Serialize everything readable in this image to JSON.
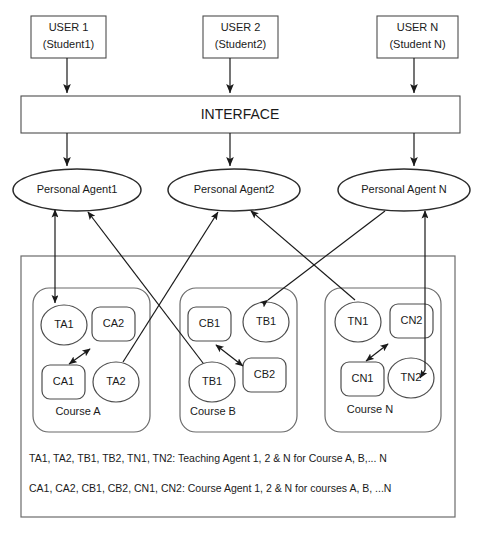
{
  "diagram": {
    "users": [
      {
        "id": "user1",
        "line1": "USER 1",
        "line2": "(Student1)"
      },
      {
        "id": "user2",
        "line1": "USER 2",
        "line2": "(Student2)"
      },
      {
        "id": "userN",
        "line1": "USER N",
        "line2": "(Student N)"
      }
    ],
    "interface": {
      "label": "INTERFACE"
    },
    "agents": [
      {
        "id": "pa1",
        "label": "Personal Agent1"
      },
      {
        "id": "pa2",
        "label": "Personal Agent2"
      },
      {
        "id": "paN",
        "label": "Personal Agent N"
      }
    ],
    "courses": [
      {
        "id": "courseA",
        "label": "Course A",
        "nodes": [
          {
            "id": "ta1",
            "label": "TA1",
            "shape": "ellipse"
          },
          {
            "id": "ca2",
            "label": "CA2",
            "shape": "rounded-rect"
          },
          {
            "id": "ca1",
            "label": "CA1",
            "shape": "rounded-rect"
          },
          {
            "id": "ta2",
            "label": "TA2",
            "shape": "ellipse"
          }
        ]
      },
      {
        "id": "courseB",
        "label": "Course B",
        "nodes": [
          {
            "id": "cb1",
            "label": "CB1",
            "shape": "rounded-rect"
          },
          {
            "id": "tb1_top",
            "label": "TB1",
            "shape": "ellipse"
          },
          {
            "id": "tb1_bottom",
            "label": "TB1",
            "shape": "ellipse"
          },
          {
            "id": "cb2",
            "label": "CB2",
            "shape": "rounded-rect"
          }
        ]
      },
      {
        "id": "courseN",
        "label": "Course N",
        "nodes": [
          {
            "id": "tn1",
            "label": "TN1",
            "shape": "ellipse"
          },
          {
            "id": "cn2",
            "label": "CN2",
            "shape": "rounded-rect"
          },
          {
            "id": "cn1",
            "label": "CN1",
            "shape": "rounded-rect"
          },
          {
            "id": "tn2",
            "label": "TN2",
            "shape": "ellipse"
          }
        ]
      }
    ],
    "legend": {
      "line1": "TA1, TA2, TB1, TB2, TN1, TN2: Teaching Agent 1, 2 & N for Course A, B,... N",
      "line2": "CA1, CA2, CB1, CB2, CN1, CN2: Course Agent 1, 2 & N for courses A, B, ...N"
    },
    "colors": {
      "stroke": "#1a1a1a",
      "box_stroke": "#4d4d4d",
      "container_stroke": "#6b6b6b",
      "background": "#ffffff",
      "text": "#1a1a1a"
    }
  }
}
